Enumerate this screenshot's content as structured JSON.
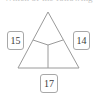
{
  "figure": {
    "clipped_header_text": "Which of the following",
    "background_color": "#ffffff",
    "stroke_color": "#9a9a9a",
    "label_border_color": "#a8a8a8",
    "label_text_color": "#3a3a3a",
    "width": 97,
    "height": 95
  },
  "triangle": {
    "name": "triangle-with-three-regions",
    "apex": {
      "x": 48,
      "y": 12
    },
    "bottom_left": {
      "x": 18,
      "y": 68
    },
    "bottom_right": {
      "x": 79,
      "y": 68
    },
    "center_point": {
      "x": 48,
      "y": 45
    },
    "partition": {
      "type": "y-partition",
      "arms": [
        {
          "from": {
            "x": 48,
            "y": 45
          },
          "to": {
            "x": 33,
            "y": 40
          }
        },
        {
          "from": {
            "x": 48,
            "y": 45
          },
          "to": {
            "x": 63,
            "y": 40
          }
        },
        {
          "from": {
            "x": 48,
            "y": 45
          },
          "to": {
            "x": 48,
            "y": 68
          }
        }
      ]
    }
  },
  "labels": [
    {
      "name": "label-left",
      "value": "15",
      "position": "left"
    },
    {
      "name": "label-right",
      "value": "14",
      "position": "right"
    },
    {
      "name": "label-bottom",
      "value": "17",
      "position": "bottom"
    }
  ]
}
